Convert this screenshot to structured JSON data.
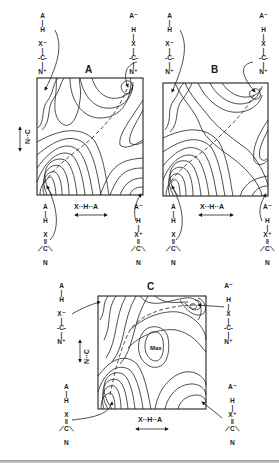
{
  "figure": {
    "panels": [
      {
        "id": "A",
        "title": "A",
        "x_axis_label": "X··H··A",
        "y_axis_label": "N··C",
        "corners": {
          "top_left": [
            "A",
            "|",
            "H",
            "",
            "X⁻",
            "|",
            "-C-",
            "|",
            "N⁺"
          ],
          "top_right": [
            "A⁻",
            "",
            "H",
            "|",
            "X",
            "|",
            "-C-",
            "|",
            "N⁺"
          ],
          "bottom_left": [
            "A",
            "|",
            "H",
            "",
            "X",
            "‖",
            "⟋C⟍",
            "",
            "N"
          ],
          "bottom_right": [
            "A⁻",
            "",
            "H",
            "|",
            "X⁺",
            "‖",
            "⟋C⟍",
            "",
            "N"
          ]
        }
      },
      {
        "id": "B",
        "title": "B",
        "x_axis_label": "X··H··A",
        "corners": {
          "top_left": [
            "A",
            "|",
            "H",
            "",
            "X⁻",
            "|",
            "-C-",
            "|",
            "N⁺"
          ],
          "top_right": [
            "A⁻",
            "",
            "H",
            "|",
            "X",
            "|",
            "-C-",
            "|",
            "N⁺"
          ],
          "bottom_left": [
            "A",
            "|",
            "H",
            "",
            "X",
            "‖",
            "⟋C⟍",
            "",
            "N"
          ],
          "bottom_right": [
            "A⁻",
            "",
            "H",
            "|",
            "X⁺",
            "‖",
            "⟋C⟍",
            "",
            "N"
          ]
        }
      },
      {
        "id": "C",
        "title": "C",
        "x_axis_label": "X··H··A",
        "y_axis_label": "N··C",
        "max_label": "Max",
        "corners": {
          "top_left": [
            "A",
            "|",
            "H",
            "",
            "X⁻",
            "|",
            "-C-",
            "|",
            "N⁺"
          ],
          "top_right": [
            "A⁻",
            "",
            "H",
            "|",
            "X",
            "|",
            "-C-",
            "|",
            "N⁺"
          ],
          "bottom_left": [
            "A",
            "|",
            "H",
            "",
            "X",
            "‖",
            "⟋C⟍",
            "",
            "N"
          ],
          "bottom_right": [
            "A⁻",
            "",
            "H",
            "|",
            "X⁺",
            "‖",
            "⟋C⟍",
            "",
            "N"
          ]
        }
      }
    ]
  }
}
